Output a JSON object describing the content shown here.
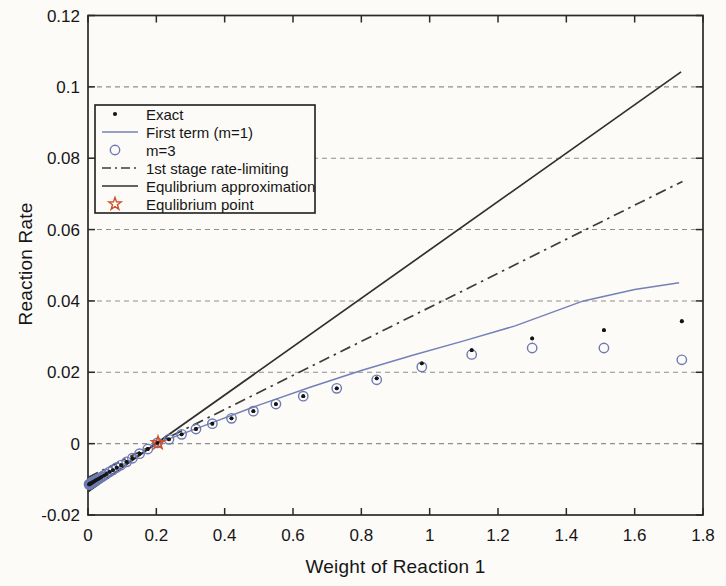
{
  "colors": {
    "background": "#fcfbf8",
    "axis": "#2a2a2a",
    "grid": "#8f8f8f",
    "tick_text": "#161616",
    "legend_border": "#1f1f1f"
  },
  "chart_data": {
    "type": "line",
    "title": "",
    "xlabel": "Weight of Reaction 1",
    "ylabel": "Reaction Rate",
    "xlim": [
      0,
      1.8
    ],
    "ylim": [
      -0.02,
      0.12
    ],
    "xticks": [
      0,
      0.2,
      0.4,
      0.6,
      0.8,
      1,
      1.2,
      1.4,
      1.6,
      1.8
    ],
    "xtick_labels": [
      "0",
      "0.2",
      "0.4",
      "0.6",
      "0.8",
      "1",
      "1.2",
      "1.4",
      "1.6",
      "1.8"
    ],
    "yticks": [
      -0.02,
      0,
      0.02,
      0.04,
      0.06,
      0.08,
      0.1,
      0.12
    ],
    "ytick_labels": [
      "-0.02",
      "0",
      "0.02",
      "0.04",
      "0.06",
      "0.08",
      "0.1",
      "0.12"
    ],
    "grid": {
      "horizontal": true,
      "vertical": false,
      "style": "dashed"
    },
    "legend": {
      "position": "upper-left-inside",
      "border": true
    },
    "series": [
      {
        "name": "Exact",
        "type": "scatter",
        "marker": "dot",
        "color": "#151515",
        "points": [
          [
            0.003,
            -0.0114
          ],
          [
            0.004,
            -0.0114
          ],
          [
            0.005,
            -0.0113
          ],
          [
            0.006,
            -0.0113
          ],
          [
            0.007,
            -0.0112
          ],
          [
            0.008,
            -0.0111
          ],
          [
            0.01,
            -0.011
          ],
          [
            0.012,
            -0.0109
          ],
          [
            0.014,
            -0.0108
          ],
          [
            0.016,
            -0.0107
          ],
          [
            0.019,
            -0.0105
          ],
          [
            0.022,
            -0.0103
          ],
          [
            0.026,
            -0.0101
          ],
          [
            0.03,
            -0.0099
          ],
          [
            0.035,
            -0.0096
          ],
          [
            0.04,
            -0.0093
          ],
          [
            0.047,
            -0.0089
          ],
          [
            0.054,
            -0.0085
          ],
          [
            0.063,
            -0.0079
          ],
          [
            0.073,
            -0.0074
          ],
          [
            0.084,
            -0.0067
          ],
          [
            0.097,
            -0.006
          ],
          [
            0.113,
            -0.0051
          ],
          [
            0.13,
            -0.0041
          ],
          [
            0.151,
            -0.0028
          ],
          [
            0.175,
            -0.0015
          ],
          [
            0.203,
            0.0002
          ],
          [
            0.237,
            0.0012
          ],
          [
            0.274,
            0.0026
          ],
          [
            0.316,
            0.0041
          ],
          [
            0.364,
            0.0056
          ],
          [
            0.42,
            0.0071
          ],
          [
            0.484,
            0.0091
          ],
          [
            0.55,
            0.0111
          ],
          [
            0.63,
            0.0133
          ],
          [
            0.728,
            0.0155
          ],
          [
            0.845,
            0.0183
          ],
          [
            0.977,
            0.0225
          ],
          [
            1.123,
            0.0262
          ],
          [
            1.3,
            0.0295
          ],
          [
            1.51,
            0.0318
          ],
          [
            1.738,
            0.0343
          ]
        ]
      },
      {
        "name": "First term (m=1)",
        "type": "line",
        "style": "solid",
        "color": "#7480b8",
        "points": [
          [
            0,
            -0.0122
          ],
          [
            0.1,
            -0.006
          ],
          [
            0.2,
            0.0
          ],
          [
            0.35,
            0.0054
          ],
          [
            0.5,
            0.0108
          ],
          [
            0.65,
            0.0158
          ],
          [
            0.8,
            0.0205
          ],
          [
            0.95,
            0.0248
          ],
          [
            1.1,
            0.0288
          ],
          [
            1.25,
            0.033
          ],
          [
            1.45,
            0.04
          ],
          [
            1.6,
            0.0432
          ],
          [
            1.73,
            0.0451
          ]
        ]
      },
      {
        "name": "m=3",
        "type": "scatter",
        "marker": "circle-open",
        "color": "#6d7ab2",
        "points": [
          [
            0.003,
            -0.0114
          ],
          [
            0.004,
            -0.0114
          ],
          [
            0.005,
            -0.0113
          ],
          [
            0.006,
            -0.0113
          ],
          [
            0.007,
            -0.0112
          ],
          [
            0.008,
            -0.0111
          ],
          [
            0.01,
            -0.011
          ],
          [
            0.012,
            -0.0109
          ],
          [
            0.014,
            -0.0108
          ],
          [
            0.016,
            -0.0107
          ],
          [
            0.019,
            -0.0105
          ],
          [
            0.022,
            -0.0103
          ],
          [
            0.026,
            -0.0101
          ],
          [
            0.03,
            -0.0099
          ],
          [
            0.035,
            -0.0096
          ],
          [
            0.04,
            -0.0093
          ],
          [
            0.047,
            -0.0089
          ],
          [
            0.054,
            -0.0085
          ],
          [
            0.063,
            -0.0079
          ],
          [
            0.073,
            -0.0074
          ],
          [
            0.084,
            -0.0067
          ],
          [
            0.097,
            -0.006
          ],
          [
            0.113,
            -0.0051
          ],
          [
            0.13,
            -0.0041
          ],
          [
            0.151,
            -0.0028
          ],
          [
            0.175,
            -0.0015
          ],
          [
            0.203,
            0.0002
          ],
          [
            0.237,
            0.0012
          ],
          [
            0.274,
            0.0026
          ],
          [
            0.316,
            0.0041
          ],
          [
            0.364,
            0.0056
          ],
          [
            0.42,
            0.0071
          ],
          [
            0.484,
            0.0091
          ],
          [
            0.55,
            0.0111
          ],
          [
            0.63,
            0.0133
          ],
          [
            0.728,
            0.0155
          ],
          [
            0.845,
            0.0179
          ],
          [
            0.977,
            0.0215
          ],
          [
            1.123,
            0.025
          ],
          [
            1.3,
            0.0268
          ],
          [
            1.51,
            0.0268
          ],
          [
            1.738,
            0.0235
          ]
        ]
      },
      {
        "name": "1st stage rate-limiting",
        "type": "line",
        "style": "dash-dot",
        "color": "#3c3c3c",
        "points": [
          [
            0,
            -0.0095
          ],
          [
            1.74,
            0.0735
          ]
        ]
      },
      {
        "name": "Equlibrium approximation",
        "type": "line",
        "style": "solid",
        "color": "#303030",
        "points": [
          [
            0,
            -0.0135
          ],
          [
            1.736,
            0.1042
          ]
        ]
      },
      {
        "name": "Equlibrium point",
        "type": "scatter",
        "marker": "star-open",
        "color": "#cf4f2a",
        "points": [
          [
            0.205,
            0.0002
          ]
        ]
      }
    ]
  }
}
